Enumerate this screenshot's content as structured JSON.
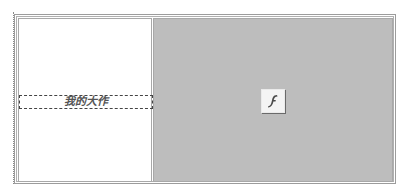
{
  "layout_table": {
    "left_cell": {
      "text_box": {
        "text": "我的大作"
      }
    },
    "right_cell": {
      "placeholder": {
        "icon": "flash-icon",
        "label": "f"
      },
      "background_color": "#bdbdbd"
    }
  }
}
